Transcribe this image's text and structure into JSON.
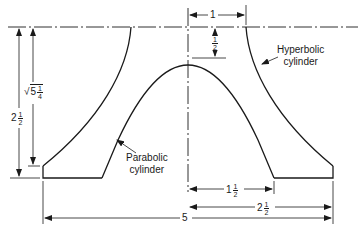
{
  "diagram": {
    "type": "engineering cross-section drawing",
    "line_color": "#1a1a1a",
    "labels": {
      "hyperbolic": {
        "line1": "Hyperbolic",
        "line2": "cylinder"
      },
      "parabolic": {
        "line1": "Parabolic",
        "line2": "cylinder"
      }
    },
    "dimensions": {
      "top_width": {
        "whole": "1",
        "num": "",
        "den": ""
      },
      "vertex_gap": {
        "whole": "",
        "num": "1",
        "den": "2"
      },
      "height_sqrt": {
        "radical": "√",
        "whole": "5",
        "num": "1",
        "den": "4"
      },
      "total_height": {
        "whole": "2",
        "num": "1",
        "den": "2"
      },
      "inner_half_width": {
        "whole": "1",
        "num": "1",
        "den": "2"
      },
      "outer_half_width": {
        "whole": "2",
        "num": "1",
        "den": "2"
      },
      "total_width": {
        "whole": "5",
        "num": "",
        "den": ""
      }
    }
  }
}
